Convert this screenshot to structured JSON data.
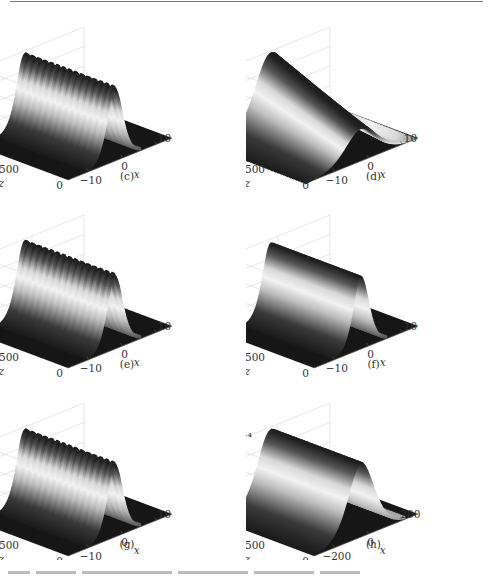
{
  "figure": {
    "panels": [
      {
        "id": "c",
        "label": "(c)",
        "zlabel": "|ψ|²",
        "zticks": [
          "0",
          "1",
          "2"
        ],
        "zmax": 2.2,
        "peak": 2.05,
        "width": 3.0,
        "ripple": true,
        "xticks": [
          "−10",
          "0",
          "10"
        ],
        "yticks": [
          "0",
          "500",
          "1000"
        ],
        "xlabel": "x",
        "ylabel": "z",
        "exponent": ""
      },
      {
        "id": "d",
        "label": "(d)",
        "zlabel": "|ψ|²",
        "zticks": [
          "0",
          "0.1",
          "0.2"
        ],
        "zmax": 0.26,
        "peak": 0.25,
        "width": 6.0,
        "ripple": false,
        "decay": true,
        "xticks": [
          "−10",
          "0",
          "10"
        ],
        "yticks": [
          "0",
          "500",
          "1000"
        ],
        "xlabel": "x",
        "ylabel": "z",
        "exponent": ""
      },
      {
        "id": "e",
        "label": "(e)",
        "zlabel": "|ψ|²",
        "zticks": [
          "0",
          "2",
          "4"
        ],
        "zmax": 4.9,
        "peak": 4.6,
        "width": 3.0,
        "ripple": true,
        "xticks": [
          "−10",
          "0",
          "10"
        ],
        "yticks": [
          "0",
          "500",
          "1000"
        ],
        "xlabel": "x",
        "ylabel": "z",
        "exponent": ""
      },
      {
        "id": "f",
        "label": "(f)",
        "zlabel": "|ψ|²",
        "zticks": [
          "0",
          "1",
          "2"
        ],
        "zmax": 2.2,
        "peak": 2.05,
        "width": 3.0,
        "ripple": false,
        "xticks": [
          "−10",
          "0",
          "10"
        ],
        "yticks": [
          "0",
          "500",
          "1000"
        ],
        "xlabel": "x",
        "ylabel": "z",
        "exponent": ""
      },
      {
        "id": "g",
        "label": "(g)",
        "zlabel": "|ψ|²",
        "zticks": [
          "0",
          "1",
          "2"
        ],
        "zmax": 2.2,
        "peak": 2.05,
        "width": 3.0,
        "ripple": true,
        "xticks": [
          "−10",
          "0",
          "10"
        ],
        "yticks": [
          "0",
          "500",
          "1000"
        ],
        "xlabel": "x",
        "ylabel": "z",
        "exponent": ""
      },
      {
        "id": "h",
        "label": "(h)",
        "zlabel": "|ψ|²",
        "zticks": [
          "0",
          "2",
          "4",
          "6",
          "8",
          "10"
        ],
        "zmax": 10.5,
        "peak": 10,
        "width": 5.0,
        "ripple": false,
        "xticks": [
          "−200",
          "0",
          "200"
        ],
        "yticks": [
          "0",
          "500",
          "1000"
        ],
        "xlabel": "x",
        "ylabel": "z",
        "exponent": "×10⁻⁴"
      }
    ]
  },
  "chart_data": [
    {
      "type": "surface",
      "title": "(c)",
      "xlabel": "x",
      "ylabel": "z",
      "zlabel": "|ψ|²",
      "xlim": [
        -15,
        15
      ],
      "ylim": [
        0,
        1000
      ],
      "zlim": [
        0,
        2.2
      ],
      "description": "Soliton propagation, peak ≈2 with small periodic oscillation along z",
      "peak": 2.0
    },
    {
      "type": "surface",
      "title": "(d)",
      "xlabel": "x",
      "ylabel": "z",
      "zlabel": "|ψ|²",
      "xlim": [
        -15,
        15
      ],
      "ylim": [
        0,
        1000
      ],
      "zlim": [
        0,
        0.25
      ],
      "description": "Broad pulse, peak ≈0.25 near z=1000 decaying to ≈0.12 at z=0",
      "peak": 0.25
    },
    {
      "type": "surface",
      "title": "(e)",
      "xlabel": "x",
      "ylabel": "z",
      "zlabel": "|ψ|²",
      "xlim": [
        -15,
        15
      ],
      "ylim": [
        0,
        1000
      ],
      "zlim": [
        0,
        4.8
      ],
      "description": "Soliton propagation, peak ≈4.5 with small ripple",
      "peak": 4.5
    },
    {
      "type": "surface",
      "title": "(f)",
      "xlabel": "x",
      "ylabel": "z",
      "zlabel": "|ψ|²",
      "xlim": [
        -15,
        15
      ],
      "ylim": [
        0,
        1000
      ],
      "zlim": [
        0,
        2.2
      ],
      "description": "Stable soliton, peak ≈2",
      "peak": 2.0
    },
    {
      "type": "surface",
      "title": "(g)",
      "xlabel": "x",
      "ylabel": "z",
      "zlabel": "|ψ|²",
      "xlim": [
        -15,
        15
      ],
      "ylim": [
        0,
        1000
      ],
      "zlim": [
        0,
        2.2
      ],
      "description": "Soliton with periodic oscillation, peak ≈2",
      "peak": 2.0
    },
    {
      "type": "surface",
      "title": "(h)",
      "xlabel": "x",
      "ylabel": "z",
      "zlabel": "|ψ|² (×10⁻⁴)",
      "xlim": [
        -250,
        250
      ],
      "ylim": [
        0,
        1000
      ],
      "zlim": [
        0,
        10
      ],
      "description": "Wide stable soliton, peak ≈10×10⁻⁴",
      "peak": 10
    }
  ]
}
